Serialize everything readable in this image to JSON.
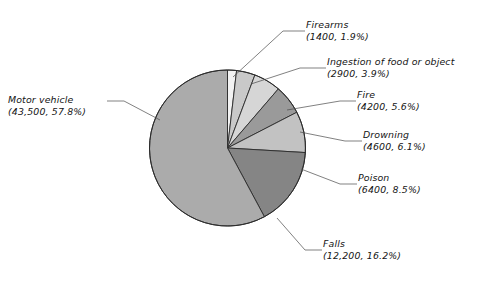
{
  "chart_data": {
    "type": "pie",
    "title": "",
    "subtitle": "",
    "xlabel": "",
    "ylabel": "",
    "legend_position": "callout-labels",
    "grid": false,
    "total": 75200,
    "categories": [
      "Firearms",
      "Ingestion of food or object",
      "Fire",
      "Drowning",
      "Poison",
      "Falls",
      "Motor vehicle"
    ],
    "values": [
      1400,
      2900,
      4200,
      4600,
      6400,
      12200,
      43500
    ],
    "percents": [
      1.9,
      3.9,
      5.6,
      6.1,
      8.5,
      16.2,
      57.8
    ],
    "value_labels": [
      "1400",
      "2900",
      "4200",
      "4600",
      "6400",
      "12,200",
      "43,500"
    ],
    "percent_labels": [
      "1.9%",
      "3.9%",
      "5.6%",
      "6.1%",
      "8.5%",
      "16.2%",
      "57.8%"
    ],
    "slice_colors": [
      "#f2f2f2",
      "#c9c9c9",
      "#d6d6d6",
      "#9a9a9a",
      "#c2c2c2",
      "#858585",
      "#ababab"
    ],
    "start_angle_deg": 0,
    "direction": "clockwise",
    "stroke_color": "#2b2b2b"
  },
  "slices": [
    {
      "name": "Firearms",
      "value_label": "1400",
      "percent_label": "1.9%",
      "percent": 1.9,
      "color": "#f2f2f2",
      "label_line1": "Firearms",
      "label_line2": "(1400, 1.9%)"
    },
    {
      "name": "Ingestion of food or object",
      "value_label": "2900",
      "percent_label": "3.9%",
      "percent": 3.9,
      "color": "#c9c9c9",
      "label_line1": "Ingestion of food or object",
      "label_line2": "(2900, 3.9%)"
    },
    {
      "name": "Fire",
      "value_label": "4200",
      "percent_label": "5.6%",
      "percent": 5.6,
      "color": "#d6d6d6",
      "label_line1": "Fire",
      "label_line2": "(4200, 5.6%)"
    },
    {
      "name": "Drowning",
      "value_label": "4600",
      "percent_label": "6.1%",
      "percent": 6.1,
      "color": "#9a9a9a",
      "label_line1": "Drowning",
      "label_line2": "(4600, 6.1%)"
    },
    {
      "name": "Poison",
      "value_label": "6400",
      "percent_label": "8.5%",
      "percent": 8.5,
      "color": "#c2c2c2",
      "label_line1": "Poison",
      "label_line2": "(6400, 8.5%)"
    },
    {
      "name": "Falls",
      "value_label": "12,200",
      "percent_label": "16.2%",
      "percent": 16.2,
      "color": "#858585",
      "label_line1": "Falls",
      "label_line2": "(12,200, 16.2%)"
    },
    {
      "name": "Motor vehicle",
      "value_label": "43,500",
      "percent_label": "57.8%",
      "percent": 57.8,
      "color": "#ababab",
      "label_line1": "Motor vehicle",
      "label_line2": "(43,500, 57.8%)"
    }
  ]
}
